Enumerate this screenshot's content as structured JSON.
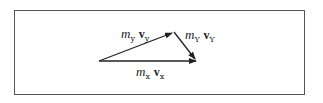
{
  "diagram": {
    "type": "vector-triangle",
    "vectors": [
      {
        "id": "vy",
        "mass": "m",
        "mass_sub": "y",
        "vel": "v",
        "vel_sub": "y"
      },
      {
        "id": "vY",
        "mass": "m",
        "mass_sub": "Y",
        "vel": "v",
        "vel_sub": "Y"
      },
      {
        "id": "vx",
        "mass": "m",
        "mass_sub": "x",
        "vel": "v",
        "vel_sub": "x"
      }
    ],
    "colors": {
      "stroke": "#222222",
      "border": "#555555"
    }
  }
}
